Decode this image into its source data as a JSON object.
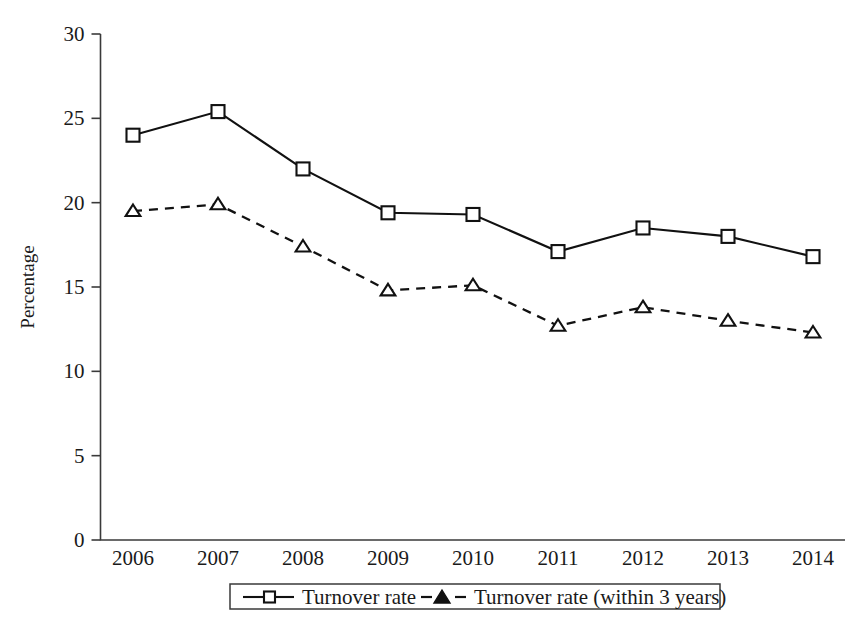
{
  "chart_data": {
    "type": "line",
    "title": "",
    "xlabel": "",
    "ylabel": "Percentage",
    "categories": [
      "2006",
      "2007",
      "2008",
      "2009",
      "2010",
      "2011",
      "2012",
      "2013",
      "2014"
    ],
    "ylim": [
      0,
      30
    ],
    "yticks": [
      0,
      5,
      10,
      15,
      20,
      25,
      30
    ],
    "ytick_labels": [
      "0",
      "5",
      "10",
      "15",
      "20",
      "25",
      "30"
    ],
    "grid": false,
    "legend_position": "bottom",
    "series": [
      {
        "name": "Turnover rate",
        "marker": "square-open",
        "linestyle": "solid",
        "color": "#111111",
        "values": [
          24.0,
          25.4,
          22.0,
          19.4,
          19.3,
          17.1,
          18.5,
          18.0,
          16.8
        ]
      },
      {
        "name": "Turnover rate (within 3 years)",
        "marker": "triangle-open",
        "linestyle": "dashed",
        "color": "#111111",
        "values": [
          19.5,
          19.9,
          17.4,
          14.8,
          15.1,
          12.7,
          13.8,
          13.0,
          12.3
        ]
      }
    ]
  },
  "legend": {
    "entries": [
      {
        "label": "Turnover rate"
      },
      {
        "label": "Turnover rate (within 3 years)"
      }
    ]
  },
  "colors": {
    "ink": "#111111",
    "axis": "#3a3a3a",
    "background": "#ffffff"
  }
}
